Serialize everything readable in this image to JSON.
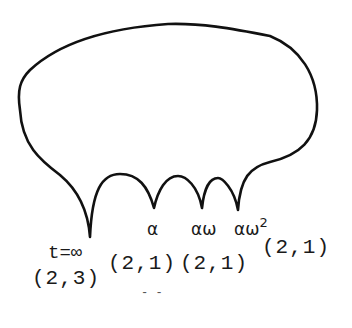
{
  "diagram": {
    "type": "curve-with-cusps",
    "stroke_color": "#111111",
    "cusps": [
      {
        "label": "t=∞",
        "type": "(2,3)"
      },
      {
        "label": "α",
        "type": "(2,1)"
      },
      {
        "label": "αω",
        "type": "(2,1)"
      },
      {
        "label": "αω",
        "label_sup": "2",
        "type": "(2,1)"
      }
    ],
    "footer_mark": "- -"
  }
}
